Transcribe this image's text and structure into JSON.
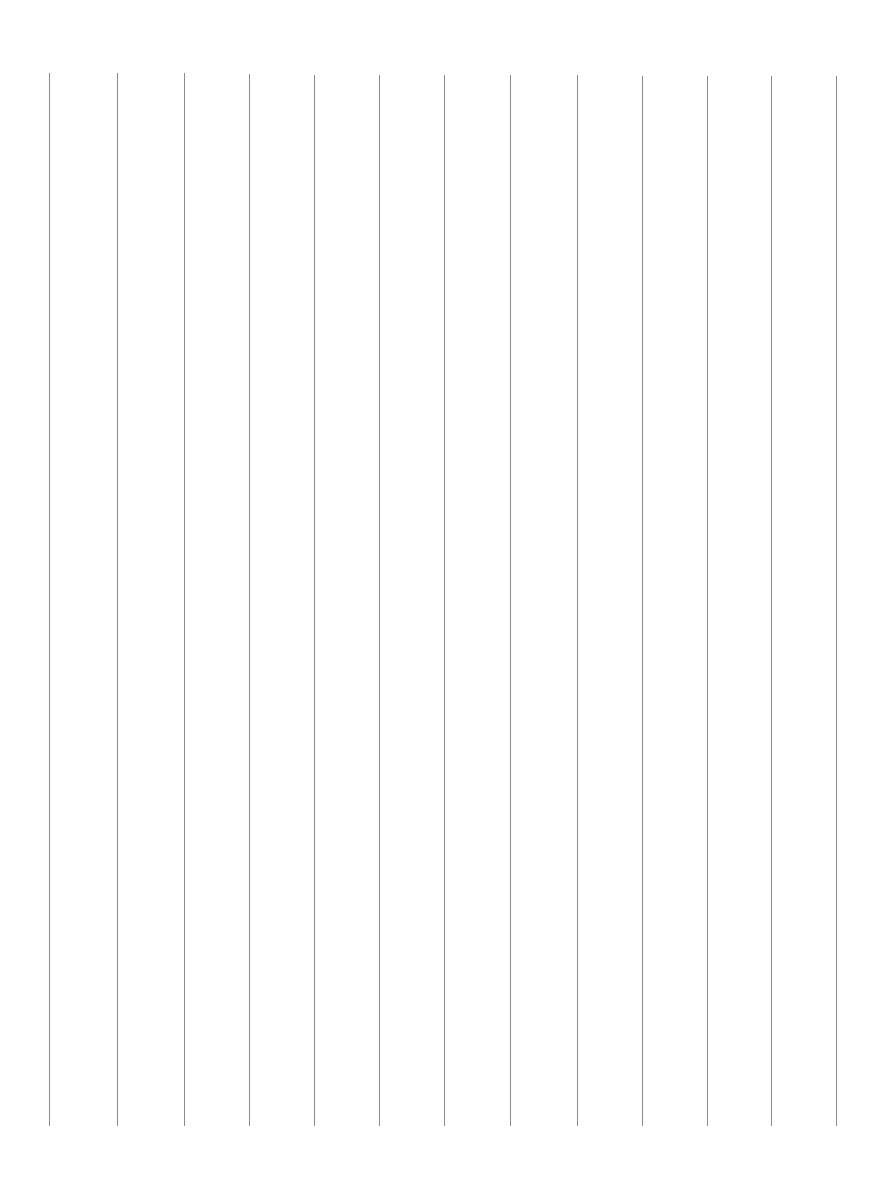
{
  "page": {
    "background": "#ffffff",
    "rule_color": "#8a8a8a",
    "rule_width_px": 1,
    "rules": [
      {
        "x": 49,
        "top": 73,
        "bottom": 1126
      },
      {
        "x": 117,
        "top": 73,
        "bottom": 1126
      },
      {
        "x": 184,
        "top": 73,
        "bottom": 1126
      },
      {
        "x": 249,
        "top": 74,
        "bottom": 1126
      },
      {
        "x": 314,
        "top": 75,
        "bottom": 1126
      },
      {
        "x": 379,
        "top": 75,
        "bottom": 1126
      },
      {
        "x": 444,
        "top": 75,
        "bottom": 1126
      },
      {
        "x": 510,
        "top": 75,
        "bottom": 1126
      },
      {
        "x": 577,
        "top": 75,
        "bottom": 1126
      },
      {
        "x": 642,
        "top": 76,
        "bottom": 1126
      },
      {
        "x": 707,
        "top": 76,
        "bottom": 1126
      },
      {
        "x": 771,
        "top": 76,
        "bottom": 1126
      },
      {
        "x": 836,
        "top": 76,
        "bottom": 1126
      }
    ]
  }
}
